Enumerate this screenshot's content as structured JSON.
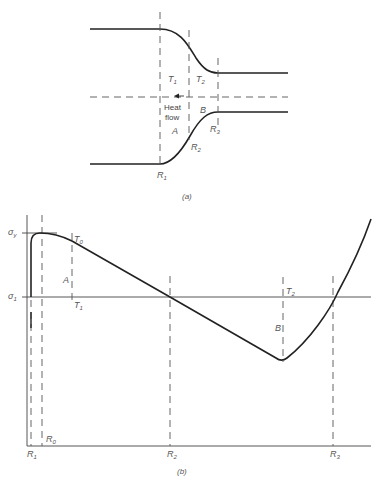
{
  "panel_a": {
    "caption": "(a)",
    "labels": {
      "T1": "T",
      "T1_sub": "1",
      "T2": "T",
      "T2_sub": "2",
      "heat": "Heat",
      "flow": "flow",
      "A": "A",
      "B": "B",
      "R1": "R",
      "R1_sub": "1",
      "R2": "R",
      "R2_sub": "2",
      "R3": "R",
      "R3_sub": "3"
    }
  },
  "panel_b": {
    "caption": "(b)",
    "labels": {
      "sigma_y": "σ",
      "sigma_y_sub": "y",
      "sigma_1": "σ",
      "sigma_1_sub": "1",
      "T0": "T",
      "T0_sub": "0",
      "T1": "T",
      "T1_sub": "1",
      "T2": "T",
      "T2_sub": "2",
      "A": "A",
      "B": "B",
      "R0": "R",
      "R0_sub": "0",
      "R1": "R",
      "R1_sub": "1",
      "R2": "R",
      "R2_sub": "2",
      "R3": "R",
      "R3_sub": "3"
    }
  }
}
